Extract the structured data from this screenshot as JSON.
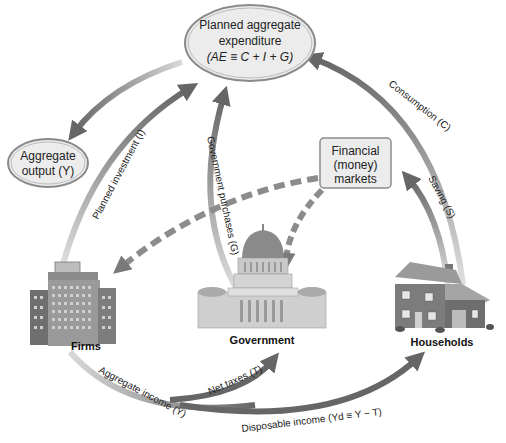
{
  "nodes": {
    "planned_ae": {
      "line1": "Planned aggregate",
      "line2": "expenditure",
      "line3": "(AE ≡ C + I + G)"
    },
    "aggregate_output": {
      "line1": "Aggregate",
      "line2": "output (Y)"
    },
    "financial_markets": {
      "line1": "Financial",
      "line2": "(money)",
      "line3": "markets"
    }
  },
  "sectors": {
    "firms": "Firms",
    "government": "Government",
    "households": "Households"
  },
  "flows": {
    "planned_investment": "Planned investment (I)",
    "government_purchases": "Government purchases (G)",
    "consumption": "Consumption (C)",
    "saving": "Saving (S)",
    "aggregate_income": "Aggregate income (Y)",
    "net_taxes": "Net taxes (T)",
    "disposable_income": "Disposable income (Yd ≡ Y − T)"
  },
  "icons": {
    "firms": "office-building-icon",
    "government": "capitol-building-icon",
    "households": "house-icon"
  },
  "colors": {
    "arrow_dark": "#6b6b6b",
    "arrow_light": "#cfcfcf",
    "node_fill": "#ececec",
    "node_stroke": "#8a8a8a",
    "dashed": "#8c8c8c"
  }
}
